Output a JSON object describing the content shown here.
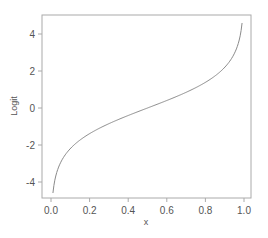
{
  "chart_data": {
    "type": "line",
    "title": "",
    "xlabel": "x",
    "ylabel": "Logit",
    "xlim": [
      -0.04,
      1.04
    ],
    "ylim": [
      -4.9,
      5.0
    ],
    "x_ticks": [
      "0.0",
      "0.2",
      "0.4",
      "0.6",
      "0.8",
      "1.0"
    ],
    "y_ticks": [
      "-4",
      "-2",
      "0",
      "2",
      "4"
    ],
    "grid": false,
    "legend": null,
    "series": [
      {
        "name": "logit(x)",
        "x": [
          0.01,
          0.02,
          0.05,
          0.1,
          0.2,
          0.3,
          0.4,
          0.5,
          0.6,
          0.7,
          0.8,
          0.9,
          0.95,
          0.98,
          0.99
        ],
        "y": [
          -4.6,
          -3.89,
          -2.94,
          -2.2,
          -1.39,
          -0.85,
          -0.41,
          0.0,
          0.41,
          0.85,
          1.39,
          2.2,
          2.94,
          3.89,
          4.6
        ]
      }
    ],
    "line_color": "#8a8a8a",
    "frame_color": "#aaaaaa"
  }
}
